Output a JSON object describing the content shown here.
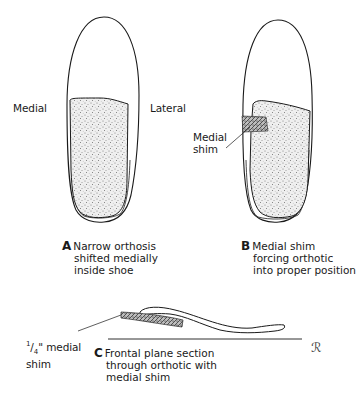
{
  "figure": {
    "panel_a": {
      "side_labels": {
        "left": "Medial",
        "right": "Lateral"
      },
      "caption_letter": "A",
      "caption_lines": [
        "Narrow orthosis",
        "shifted medially",
        "inside shoe"
      ]
    },
    "panel_b": {
      "callout": [
        "Medial",
        "shim"
      ],
      "caption_letter": "B",
      "caption_lines": [
        "Medial shim",
        "forcing orthotic",
        "into proper position"
      ]
    },
    "panel_c": {
      "callout_fraction_num": "1",
      "callout_fraction_den": "4",
      "callout_rest": "\" medial",
      "callout_line2": "shim",
      "caption_letter": "C",
      "caption_lines": [
        "Frontal plane section",
        "through orthotic with",
        "medial shim"
      ]
    },
    "signature": "ℛ",
    "colors": {
      "ink": "#1a1a1a",
      "stipple": "#8a8a8a",
      "background": "#ffffff"
    }
  }
}
